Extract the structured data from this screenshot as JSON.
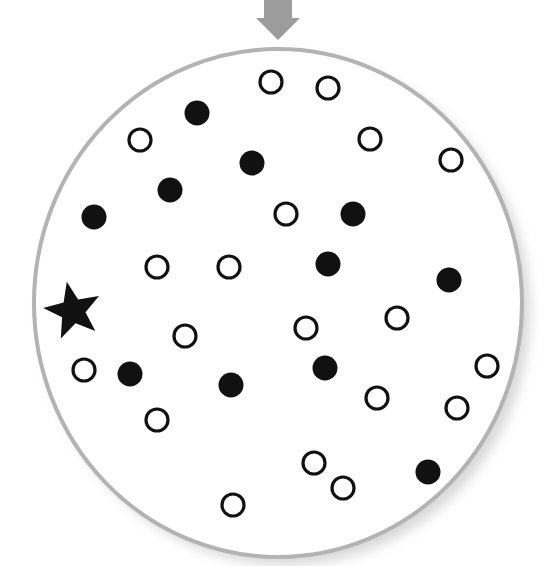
{
  "diagram": {
    "colors": {
      "background": "#ffffff",
      "ring": "#b3b3b3",
      "shadow": "#d8d8d8",
      "arrow": "#9c9c9c",
      "marker": "#111111"
    },
    "arrow": {
      "icon": "down-arrow-icon",
      "tip": [
        278,
        40
      ]
    },
    "container": {
      "shape": "ellipse",
      "cx": 278,
      "cy": 303,
      "rx": 244,
      "ry": 254
    },
    "star": {
      "icon": "star-icon",
      "cx": 73,
      "cy": 311,
      "r": 30
    },
    "dot_radius": 12.5,
    "open_dots": [
      [
        271,
        82
      ],
      [
        328,
        88
      ],
      [
        140,
        140
      ],
      [
        370,
        139
      ],
      [
        451,
        160
      ],
      [
        286,
        214
      ],
      [
        157,
        267
      ],
      [
        229,
        267
      ],
      [
        185,
        336
      ],
      [
        306,
        328
      ],
      [
        397,
        318
      ],
      [
        84,
        370
      ],
      [
        487,
        366
      ],
      [
        377,
        398
      ],
      [
        457,
        408
      ],
      [
        157,
        420
      ],
      [
        314,
        463
      ],
      [
        343,
        488
      ],
      [
        233,
        505
      ]
    ],
    "filled_dots": [
      [
        197,
        113
      ],
      [
        252,
        163
      ],
      [
        170,
        190
      ],
      [
        94,
        217
      ],
      [
        353,
        214
      ],
      [
        328,
        264
      ],
      [
        449,
        280
      ],
      [
        130,
        374
      ],
      [
        231,
        385
      ],
      [
        325,
        368
      ],
      [
        428,
        472
      ]
    ],
    "counts": {
      "open": 19,
      "filled": 11,
      "star": 1
    }
  }
}
